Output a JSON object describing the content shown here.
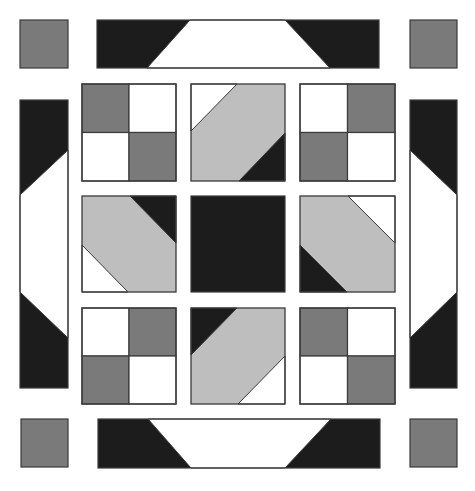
{
  "colors": {
    "background": "#ffffff",
    "dark": "#1c1c1c",
    "medium": "#7a7a7a",
    "light": "#bebebe",
    "white": "#ffffff",
    "outline": "#3a3a3a"
  },
  "corner_squares": [
    {
      "name": "corner-square-top-left",
      "x": 20,
      "y": 20,
      "w": 48,
      "h": 48,
      "fill": "medium"
    },
    {
      "name": "corner-square-top-right",
      "x": 410,
      "y": 20,
      "w": 47,
      "h": 48,
      "fill": "medium"
    },
    {
      "name": "corner-square-bottom-left",
      "x": 21,
      "y": 419,
      "w": 47,
      "h": 48,
      "fill": "medium"
    },
    {
      "name": "corner-square-bottom-right",
      "x": 410,
      "y": 419,
      "w": 47,
      "h": 48,
      "fill": "medium"
    }
  ],
  "border_strips": [
    {
      "name": "border-strip-top",
      "x": 97,
      "y": 20,
      "w": 282,
      "h": 48,
      "white_polygon": [
        [
          190,
          20
        ],
        [
          285,
          20
        ],
        [
          330,
          68
        ],
        [
          147,
          68
        ]
      ]
    },
    {
      "name": "border-strip-bottom",
      "x": 98,
      "y": 419,
      "w": 282,
      "h": 49,
      "white_polygon": [
        [
          148,
          419
        ],
        [
          331,
          419
        ],
        [
          285,
          468
        ],
        [
          191,
          468
        ]
      ]
    },
    {
      "name": "border-strip-left",
      "x": 20,
      "y": 100,
      "w": 48,
      "h": 288,
      "white_polygon": [
        [
          68,
          150
        ],
        [
          68,
          338
        ],
        [
          20,
          292
        ],
        [
          20,
          195
        ]
      ]
    },
    {
      "name": "border-strip-right",
      "x": 410,
      "y": 100,
      "w": 47,
      "h": 288,
      "white_polygon": [
        [
          410,
          150
        ],
        [
          457,
          195
        ],
        [
          457,
          292
        ],
        [
          410,
          338
        ]
      ]
    }
  ],
  "blocks": [
    {
      "name": "four-patch-top-left",
      "type": "four-patch",
      "x": 82,
      "y": 84,
      "w": 94,
      "h": 97,
      "quadrants": [
        "medium",
        "white",
        "white",
        "medium"
      ]
    },
    {
      "name": "diagonal-block-top-center",
      "type": "diagonal",
      "x": 191,
      "y": 84,
      "w": 94,
      "h": 97,
      "polys": [
        {
          "fill": "white",
          "pts": [
            [
              191,
              84
            ],
            [
              237,
              84
            ],
            [
              191,
              131
            ]
          ]
        },
        {
          "fill": "dark",
          "pts": [
            [
              285,
              133
            ],
            [
              285,
              181
            ],
            [
              239,
              181
            ]
          ]
        }
      ]
    },
    {
      "name": "four-patch-top-right",
      "type": "four-patch",
      "x": 300,
      "y": 84,
      "w": 95,
      "h": 97,
      "quadrants": [
        "white",
        "medium",
        "medium",
        "white"
      ]
    },
    {
      "name": "diagonal-block-middle-left",
      "type": "diagonal",
      "x": 82,
      "y": 196,
      "w": 94,
      "h": 96,
      "polys": [
        {
          "fill": "dark",
          "pts": [
            [
              130,
              196
            ],
            [
              176,
              196
            ],
            [
              176,
              243
            ]
          ]
        },
        {
          "fill": "white",
          "pts": [
            [
              82,
              245
            ],
            [
              128,
              292
            ],
            [
              82,
              292
            ]
          ]
        }
      ]
    },
    {
      "name": "center-square",
      "type": "solid",
      "x": 191,
      "y": 196,
      "w": 94,
      "h": 96,
      "fill": "dark"
    },
    {
      "name": "diagonal-block-middle-right",
      "type": "diagonal",
      "x": 300,
      "y": 196,
      "w": 95,
      "h": 96,
      "polys": [
        {
          "fill": "white",
          "pts": [
            [
              348,
              196
            ],
            [
              395,
              196
            ],
            [
              395,
              243
            ]
          ]
        },
        {
          "fill": "dark",
          "pts": [
            [
              300,
              245
            ],
            [
              347,
              292
            ],
            [
              300,
              292
            ]
          ]
        }
      ]
    },
    {
      "name": "four-patch-bottom-left",
      "type": "four-patch",
      "x": 82,
      "y": 308,
      "w": 94,
      "h": 96,
      "quadrants": [
        "white",
        "medium",
        "medium",
        "white"
      ]
    },
    {
      "name": "diagonal-block-bottom-center",
      "type": "diagonal",
      "x": 191,
      "y": 308,
      "w": 94,
      "h": 96,
      "polys": [
        {
          "fill": "dark",
          "pts": [
            [
              191,
              308
            ],
            [
              237,
              308
            ],
            [
              191,
              355
            ]
          ]
        },
        {
          "fill": "white",
          "pts": [
            [
              285,
              356
            ],
            [
              285,
              404
            ],
            [
              238,
              404
            ]
          ]
        }
      ]
    },
    {
      "name": "four-patch-bottom-right",
      "type": "four-patch",
      "x": 300,
      "y": 308,
      "w": 95,
      "h": 96,
      "quadrants": [
        "medium",
        "white",
        "white",
        "medium"
      ]
    }
  ]
}
